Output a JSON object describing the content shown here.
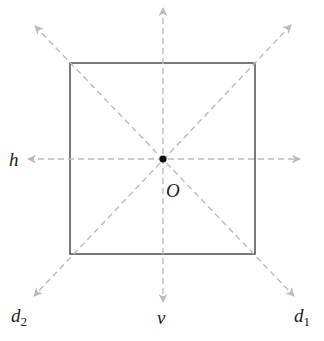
{
  "figure": {
    "square": {
      "x": 70,
      "y": 63,
      "width": 185,
      "height": 191,
      "stroke": "#333333"
    },
    "center": {
      "label": "O",
      "x": 163,
      "y": 159
    },
    "axis_color": "#bbbbbb",
    "axes": [
      {
        "name": "h",
        "label": "h",
        "sub": "",
        "orientation": "horizontal"
      },
      {
        "name": "v",
        "label": "v",
        "sub": "",
        "orientation": "vertical"
      },
      {
        "name": "d1",
        "label": "d",
        "sub": "1",
        "orientation": "diagonal (top-left to bottom-right)"
      },
      {
        "name": "d2",
        "label": "d",
        "sub": "2",
        "orientation": "diagonal (top-right to bottom-left)"
      }
    ]
  }
}
